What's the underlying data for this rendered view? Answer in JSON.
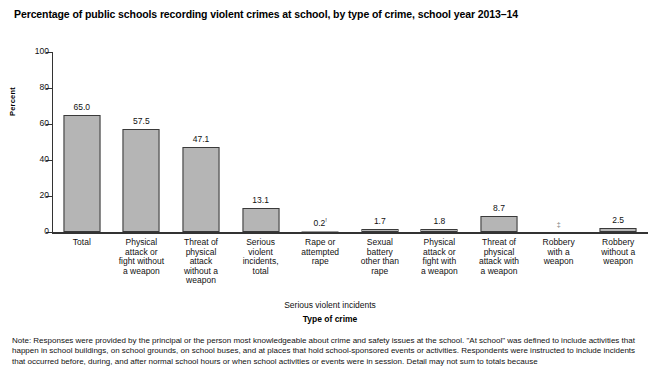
{
  "title": "Percentage of public schools recording violent crimes at school, by type of crime, school year 2013–14",
  "ylabel": "Percent",
  "xlabel": "Type of crime",
  "group_label": "Serious violent incidents",
  "note": {
    "line1": "Note: Responses were provided by the principal or the person most knowledgeable about crime and safety issues at the school. \"At school\" was defined to include activities that",
    "line2": "happen in school buildings, on school grounds, on school buses, and at places that hold school-sponsored events or activities. Respondents were instructed to include incidents",
    "line3": "that occurred before, during, and after normal school hours or when school activities or events were in session. Detail may not sum to totals because"
  },
  "chart_data": {
    "type": "bar",
    "title": "Percentage of public schools recording violent crimes at school, by type of crime, school year 2013–14",
    "xlabel": "Type of crime",
    "ylabel": "Percent",
    "ylim": [
      0,
      100
    ],
    "yticks": [
      "0",
      "20",
      "40",
      "60",
      "80",
      "100"
    ],
    "grid": false,
    "legend": null,
    "categories": [
      "Total",
      "Physical attack or fight without a weapon",
      "Threat of physical attack without a weapon",
      "Serious violent incidents, total",
      "Rape or attempted rape",
      "Sexual battery other than rape",
      "Physical attack or fight with a weapon",
      "Threat of physical attack with a weapon",
      "Robbery with a weapon",
      "Robbery without a weapon"
    ],
    "values": [
      65.0,
      57.5,
      47.1,
      13.1,
      0.2,
      1.7,
      1.8,
      8.7,
      null,
      2.5
    ],
    "value_labels": [
      "65.0",
      "57.5",
      "47.1",
      "13.1",
      "0.2",
      "1.7",
      "1.8",
      "8.7",
      "‡",
      "2.5"
    ],
    "annotations": {
      "rape_superscript": "!",
      "robbery_with_weapon_symbol": "‡",
      "group_bracket_label": "Serious violent incidents",
      "group_bracket_members": [
        "Rape or attempted rape",
        "Sexual battery other than rape",
        "Physical attack or fight with a weapon",
        "Threat of physical attack with a weapon",
        "Robbery with a weapon",
        "Robbery without a weapon"
      ]
    }
  },
  "categories_display": [
    {
      "lines": [
        "Total"
      ]
    },
    {
      "lines": [
        "Physical",
        "attack or",
        "fight without",
        "a weapon"
      ]
    },
    {
      "lines": [
        "Threat of",
        "physical",
        "attack",
        "without a",
        "weapon"
      ]
    },
    {
      "lines": [
        "Serious",
        "violent",
        "incidents,",
        "total"
      ]
    },
    {
      "lines": [
        "Rape or",
        "attempted",
        "rape"
      ]
    },
    {
      "lines": [
        "Sexual",
        "battery",
        "other than",
        "rape"
      ]
    },
    {
      "lines": [
        "Physical",
        "attack or",
        "fight with",
        "a weapon"
      ]
    },
    {
      "lines": [
        "Threat of",
        "physical",
        "attack with",
        "a weapon"
      ]
    },
    {
      "lines": [
        "Robbery",
        "with a",
        "weapon"
      ]
    },
    {
      "lines": [
        "Robbery",
        "without a",
        "weapon"
      ]
    }
  ],
  "colors": {
    "bar_fill": "#b5b5b5",
    "bar_border": "#3a3a3a",
    "axis": "#333333",
    "text": "#111111"
  }
}
